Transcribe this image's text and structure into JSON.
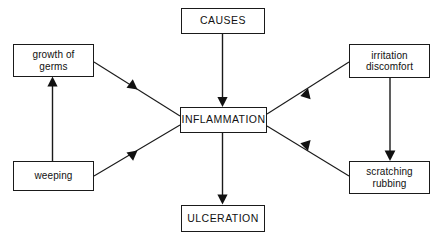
{
  "diagram": {
    "background_color": "#ffffff",
    "line_color": "#1a1a1a",
    "nodes": {
      "causes": "CAUSES",
      "growth_of_germs": "growth of\ngerms",
      "irritation_discomfort": "irritation\ndiscomfort",
      "inflammation": "INFLAMMATION",
      "weeping": "weeping",
      "scratching_rubbing": "scratching\nrubbing",
      "ulceration": "ULCERATION"
    },
    "edges": [
      {
        "name": "causes-to-inflammation",
        "from": "causes",
        "to": "inflammation",
        "style": "straight-vertical"
      },
      {
        "name": "inflammation-to-ulceration",
        "from": "inflammation",
        "to": "ulceration",
        "style": "straight-vertical"
      },
      {
        "name": "weeping-to-growth-of-germs",
        "from": "weeping",
        "to": "growth_of_germs",
        "style": "straight-vertical"
      },
      {
        "name": "irritation-to-scratching",
        "from": "irritation_discomfort",
        "to": "scratching_rubbing",
        "style": "straight-vertical"
      },
      {
        "name": "growth-to-inflammation",
        "from": "growth_of_germs",
        "to": "inflammation",
        "style": "diagonal"
      },
      {
        "name": "weeping-to-inflammation",
        "from": "weeping",
        "to": "inflammation",
        "style": "diagonal"
      },
      {
        "name": "inflammation-to-irritation",
        "from": "inflammation",
        "to": "irritation_discomfort",
        "style": "diagonal"
      },
      {
        "name": "inflammation-to-scratching",
        "from": "inflammation",
        "to": "scratching_rubbing",
        "style": "diagonal"
      }
    ]
  }
}
